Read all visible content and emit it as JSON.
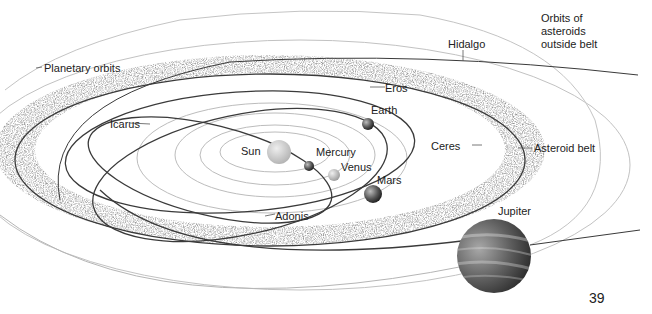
{
  "diagram": {
    "labels": {
      "planetary_orbits": "Planetary orbits",
      "hidalgo": "Hidalgo",
      "orbits_outside_belt": [
        "Orbits of",
        "asteroids",
        "outside belt"
      ],
      "eros": "Eros",
      "icarus": "Icarus",
      "earth": "Earth",
      "sun": "Sun",
      "mercury": "Mercury",
      "venus": "Venus",
      "mars": "Mars",
      "ceres": "Ceres",
      "asteroid_belt": "Asteroid belt",
      "adonis": "Adonis",
      "jupiter": "Jupiter"
    },
    "page_number": "39",
    "colors": {
      "background": "#ffffff",
      "orbit_light": "#b8b8b8",
      "orbit_dark": "#3a3a3a",
      "belt_speckle": "#6a6a6a",
      "sun": "#d4d4d4",
      "jupiter": "#5a5a5a",
      "text": "#222222"
    }
  }
}
